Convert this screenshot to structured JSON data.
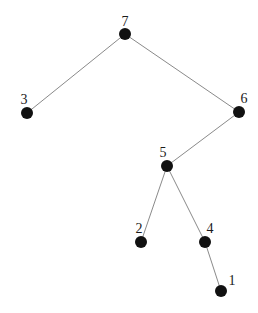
{
  "diagram": {
    "type": "tree",
    "colors": {
      "background": "#ffffff",
      "node": "#111111",
      "edge": "#8a8a8a",
      "label": "#1a1a1a"
    },
    "node_radius": 6,
    "nodes": [
      {
        "id": "7",
        "label": "7",
        "x": 125,
        "y": 34,
        "lx": 125,
        "ly": 26
      },
      {
        "id": "3",
        "label": "3",
        "x": 27,
        "y": 113,
        "lx": 24,
        "ly": 104
      },
      {
        "id": "6",
        "label": "6",
        "x": 239,
        "y": 112,
        "lx": 244,
        "ly": 103
      },
      {
        "id": "5",
        "label": "5",
        "x": 167,
        "y": 166,
        "lx": 163,
        "ly": 157
      },
      {
        "id": "2",
        "label": "2",
        "x": 141,
        "y": 242,
        "lx": 139,
        "ly": 233
      },
      {
        "id": "4",
        "label": "4",
        "x": 205,
        "y": 242,
        "lx": 210,
        "ly": 233
      },
      {
        "id": "1",
        "label": "1",
        "x": 221,
        "y": 291,
        "lx": 232,
        "ly": 285
      }
    ],
    "edges": [
      {
        "from": "7",
        "to": "3"
      },
      {
        "from": "7",
        "to": "6"
      },
      {
        "from": "6",
        "to": "5"
      },
      {
        "from": "5",
        "to": "2"
      },
      {
        "from": "5",
        "to": "4"
      },
      {
        "from": "4",
        "to": "1"
      }
    ]
  }
}
